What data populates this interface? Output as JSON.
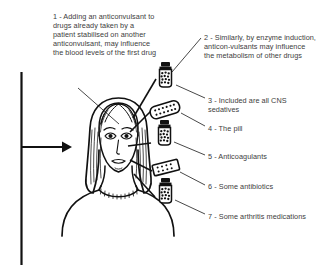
{
  "figure": {
    "type": "medical-illustration-diagram",
    "line_color": "#111111",
    "text_color": "#3d3d3d",
    "background_color": "#ffffff"
  },
  "annotations": [
    {
      "number": "1",
      "text": "1 - Adding an anticonvulsant to drugs already taken by a patient stabilised on another anticonvulsant, may influence the blood levels of the first drug",
      "position": "top-left"
    },
    {
      "number": "2",
      "text": "2 - Similarly, by enzyme induction, anticon-vulsants may influence the metabolism of other drugs",
      "position": "top-right"
    },
    {
      "number": "3",
      "text": "3 - Included are all CNS sedatives",
      "position": "right"
    },
    {
      "number": "4",
      "text": "4 - The pill",
      "position": "right"
    },
    {
      "number": "5",
      "text": "5 - Anticoagulants",
      "position": "right"
    },
    {
      "number": "6",
      "text": "6 - Some antibiotics",
      "position": "right"
    },
    {
      "number": "7",
      "text": "7 - Some arthritis medications",
      "position": "right"
    }
  ],
  "graphics": {
    "head_figure": "woman-head-portrait",
    "input_arrow": "arrow-right",
    "vertical_rule": "left-vertical-line",
    "drug_items": [
      {
        "id": "item-3",
        "icon": "pill-bottle-icon"
      },
      {
        "id": "item-4",
        "icon": "blister-pack-icon"
      },
      {
        "id": "item-5",
        "icon": "pill-bottle-icon"
      },
      {
        "id": "item-6",
        "icon": "blister-pack-small-icon"
      },
      {
        "id": "item-7",
        "icon": "pill-bottle-icon"
      }
    ]
  }
}
